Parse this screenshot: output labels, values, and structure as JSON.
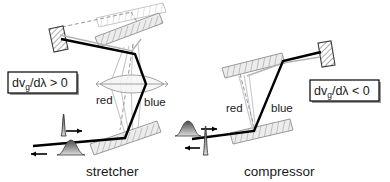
{
  "figure": {
    "background_color": "#ffffff",
    "width": 390,
    "height": 182
  },
  "panels": [
    {
      "id": "stretcher",
      "caption": "stretcher",
      "formula": {
        "lead": "dv",
        "subscript": "g",
        "rest": "/dλ > 0"
      },
      "formula_text": "dv_g/dλ > 0",
      "wavelength_labels": {
        "red": "red",
        "blue": "blue"
      },
      "input_pulse": "short",
      "output_pulse": "long",
      "input_arrow_direction": "right",
      "output_arrow_direction": "left",
      "optics": [
        "grating",
        "grating",
        "lens",
        "end-mirror",
        "ghost-grating"
      ]
    },
    {
      "id": "compressor",
      "caption": "compressor",
      "formula": {
        "lead": "dv",
        "subscript": "g",
        "rest": "/dλ < 0"
      },
      "formula_text": "dv_g/dλ < 0",
      "wavelength_labels": {
        "red": "red",
        "blue": "blue"
      },
      "input_pulse": "long",
      "output_pulse": "short",
      "input_arrow_direction": "right",
      "output_arrow_direction": "left",
      "optics": [
        "grating",
        "grating",
        "end-mirror"
      ]
    }
  ],
  "colors": {
    "beam": "#000000",
    "beam_secondary": "#b4b4b4",
    "optic_fill": "#ececec",
    "optic_stroke": "#8e8e8e",
    "text": "#1a1a1a",
    "box_border": "#000000",
    "box_shadow": "#9a9a9a",
    "background": "#ffffff"
  }
}
